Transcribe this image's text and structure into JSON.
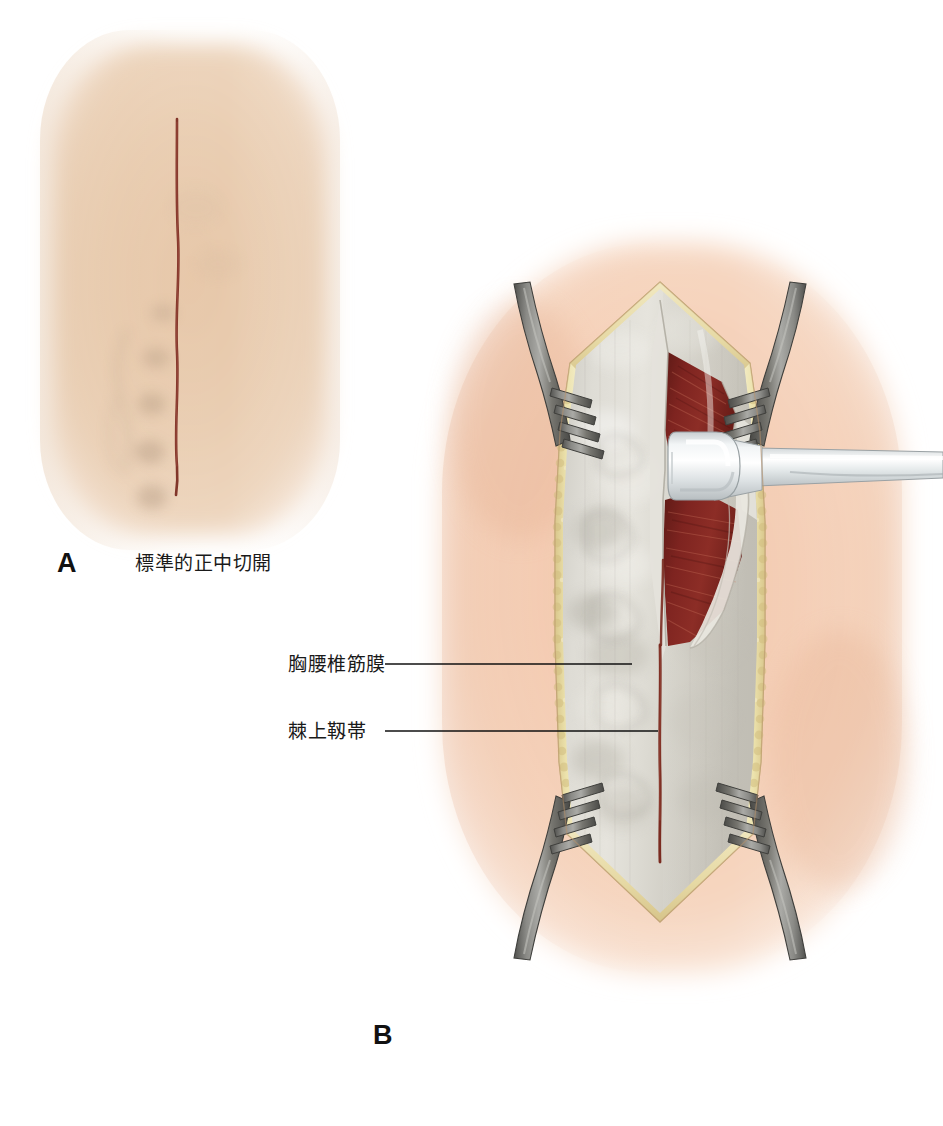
{
  "figure": {
    "type": "medical-illustration",
    "background_color": "#ffffff"
  },
  "panels": [
    {
      "id": "A",
      "letter": "A",
      "caption": "標準的正中切開",
      "description": "skin surface with planned midline incision line",
      "skin_color": "#e8cdb0",
      "incision_color": "#7c2d22"
    },
    {
      "id": "B",
      "letter": "B",
      "caption": "",
      "description": "retracted wound exposing thoracolumbar fascia and supraspinous ligament",
      "skin_color": "#f4cdb4",
      "fat_color": "#e5dba8",
      "fascia_color": "#d8d6d0",
      "muscle_color": "#7e2420",
      "retractor_color": "#6b6b68",
      "instrument_color": "#eceff0",
      "incision_color": "#7a2b20"
    }
  ],
  "annotations": [
    {
      "id": "fascia",
      "label": "胸腰椎筋膜",
      "leader_line_color": "#111111",
      "leader_from_x": 385,
      "leader_to_x": 632,
      "leader_y": 664
    },
    {
      "id": "ligament",
      "label": "棘上靱帯",
      "leader_line_color": "#111111",
      "leader_from_x": 385,
      "leader_to_x": 658,
      "leader_y": 731
    }
  ],
  "instruments": [
    {
      "name": "rake-retractor",
      "count": 4,
      "teeth": 4,
      "color": "#6b6b68"
    },
    {
      "name": "cobb-periosteal-elevator",
      "count": 1,
      "color": "#eceff0"
    }
  ]
}
